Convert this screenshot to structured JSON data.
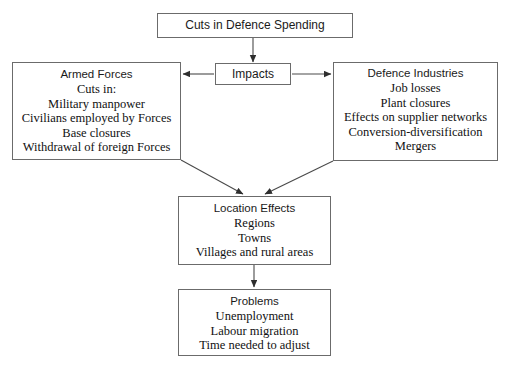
{
  "diagram": {
    "title_box": {
      "heading": "Cuts in Defence Spending"
    },
    "impacts_box": {
      "heading": "Impacts"
    },
    "armed_forces_box": {
      "heading": "Armed Forces",
      "lines": [
        "Cuts in:",
        "Military manpower",
        "Civilians employed by Forces",
        "Base closures",
        "Withdrawal of foreign Forces"
      ]
    },
    "defence_industries_box": {
      "heading": "Defence Industries",
      "lines": [
        "Job losses",
        "Plant closures",
        "Effects on supplier networks",
        "Conversion-diversification",
        "Mergers"
      ]
    },
    "location_effects_box": {
      "heading": "Location Effects",
      "lines": [
        "Regions",
        "Towns",
        "Villages and rural areas"
      ]
    },
    "problems_box": {
      "heading": "Problems",
      "lines": [
        "Unemployment",
        "Labour migration",
        "Time needed to adjust"
      ]
    },
    "colors": {
      "background": "#ffffff",
      "box_border": "#6b6b6b",
      "connector": "#4a4a4a",
      "text": "#111111"
    },
    "connectors": [
      {
        "name": "title-to-impacts",
        "from": "title_box",
        "to": "impacts_box",
        "direction": "down"
      },
      {
        "name": "impacts-to-armed-forces",
        "from": "impacts_box",
        "to": "armed_forces_box",
        "direction": "left"
      },
      {
        "name": "impacts-to-defence-industries",
        "from": "impacts_box",
        "to": "defence_industries_box",
        "direction": "right"
      },
      {
        "name": "armed-forces-to-location-effects",
        "from": "armed_forces_box",
        "to": "location_effects_box",
        "direction": "diagonal-down-right"
      },
      {
        "name": "defence-industries-to-location-effects",
        "from": "defence_industries_box",
        "to": "location_effects_box",
        "direction": "diagonal-down-left"
      },
      {
        "name": "location-effects-to-problems",
        "from": "location_effects_box",
        "to": "problems_box",
        "direction": "down"
      }
    ]
  }
}
